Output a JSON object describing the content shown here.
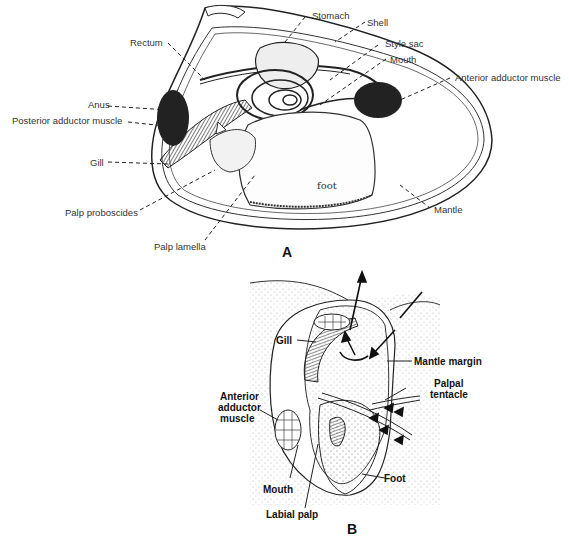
{
  "figure_a": {
    "panel_label": "A",
    "labels": {
      "stomach": "Stomach",
      "shell": "Shell",
      "rectum": "Rectum",
      "style_sac": "Style sac",
      "mouth": "Mouth",
      "anterior_adductor": "Anterior adductor muscle",
      "anus": "Anus",
      "posterior_adductor": "Posterior adductor muscle",
      "gill": "Gill",
      "foot": "foot",
      "palp_proboscides": "Palp proboscides",
      "mantle": "Mantle",
      "palp_lamella": "Palp lamella"
    }
  },
  "figure_b": {
    "panel_label": "B",
    "labels": {
      "gill": "Gill",
      "mantle_margin": "Mantle margin",
      "palpal": "Palpal",
      "tentacle": "tentacle",
      "anterior": "Anterior",
      "adductor": "adductor",
      "muscle": "muscle",
      "mouth": "Mouth",
      "foot": "Foot",
      "labial_palp": "Labial palp"
    }
  }
}
